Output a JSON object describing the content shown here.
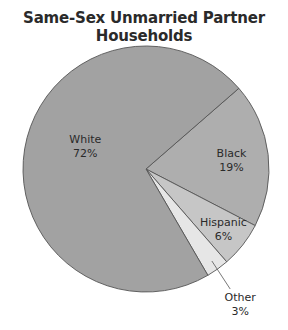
{
  "chart_data": {
    "type": "pie",
    "title": "Same-Sex Unmarried Partner Households",
    "start_angle_deg": -41,
    "direction": "clockwise",
    "slices": [
      {
        "label": "Black",
        "value": 19,
        "value_label": "19%",
        "color": "#aeaeae"
      },
      {
        "label": "Hispanic",
        "value": 6,
        "value_label": "6%",
        "color": "#c6c6c6"
      },
      {
        "label": "Other",
        "value": 3,
        "value_label": "3%",
        "color": "#e6e6e6",
        "label_outside": true
      },
      {
        "label": "White",
        "value": 72,
        "value_label": "72%",
        "color": "#a2a2a2"
      }
    ],
    "legend": "none"
  }
}
